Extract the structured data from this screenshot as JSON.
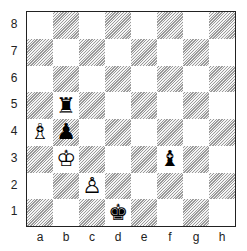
{
  "board": {
    "ranks": [
      "8",
      "7",
      "6",
      "5",
      "4",
      "3",
      "2",
      "1"
    ],
    "files": [
      "a",
      "b",
      "c",
      "d",
      "e",
      "f",
      "g",
      "h"
    ],
    "pieces": [
      {
        "square": "b5",
        "color": "black",
        "type": "rook",
        "glyph": "♜"
      },
      {
        "square": "a4",
        "color": "white",
        "type": "bishop",
        "glyph": "♗"
      },
      {
        "square": "b4",
        "color": "black",
        "type": "pawn",
        "glyph": "♟"
      },
      {
        "square": "b3",
        "color": "white",
        "type": "king",
        "glyph": "♔"
      },
      {
        "square": "f3",
        "color": "black",
        "type": "bishop",
        "glyph": "♝"
      },
      {
        "square": "c2",
        "color": "white",
        "type": "pawn",
        "glyph": "♙"
      },
      {
        "square": "d1",
        "color": "black",
        "type": "king",
        "glyph": "♚"
      }
    ]
  }
}
